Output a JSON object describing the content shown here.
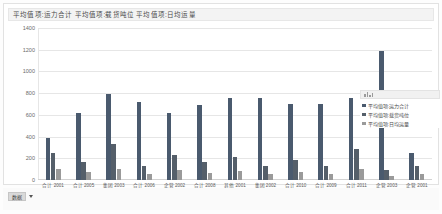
{
  "title": "平均值项:运力合计 平均值项:载货吨位 平均值项:日均运量",
  "bottom": {
    "data_button_label": "数据",
    "caret_icon": "chevron-down-icon"
  },
  "legend": {
    "header_icon": "chart-icon",
    "entries": [
      {
        "label": "平均值项:运力合计",
        "color": "#4a5a6e"
      },
      {
        "label": "平均值项:载货吨位",
        "color": "#555f6a"
      },
      {
        "label": "平均值项:日均运量",
        "color": "#9a9a9a"
      }
    ]
  },
  "chart_data": {
    "type": "bar",
    "title": "平均值项:运力合计 平均值项:载货吨位 平均值项:日均运量",
    "xlabel": "",
    "ylabel": "",
    "ylim": [
      0,
      1400
    ],
    "yticks": [
      0,
      200,
      400,
      600,
      800,
      1000,
      1200,
      1400
    ],
    "grid": true,
    "legend_position": "right",
    "categories": [
      "合计 2001",
      "合计 2005",
      "集团 2003",
      "合计 2006",
      "企管 2002",
      "合计 2008",
      "其他 2001",
      "集团 2002",
      "合计 2010",
      "合计 2009",
      "合计 2011",
      "企管 2003",
      "企管 2001"
    ],
    "series": [
      {
        "name": "平均值项:运力合计",
        "color": "#4a5a6e",
        "values": [
          390,
          620,
          790,
          720,
          620,
          690,
          760,
          760,
          700,
          700,
          760,
          1190,
          250
        ]
      },
      {
        "name": "平均值项:载货吨位",
        "color": "#555f6a",
        "values": [
          250,
          170,
          330,
          130,
          230,
          165,
          215,
          130,
          180,
          130,
          290,
          95,
          130
        ]
      },
      {
        "name": "平均值项:日均运量",
        "color": "#9a9a9a",
        "values": [
          105,
          70,
          100,
          60,
          95,
          65,
          85,
          55,
          75,
          55,
          105,
          40,
          55
        ]
      }
    ]
  }
}
